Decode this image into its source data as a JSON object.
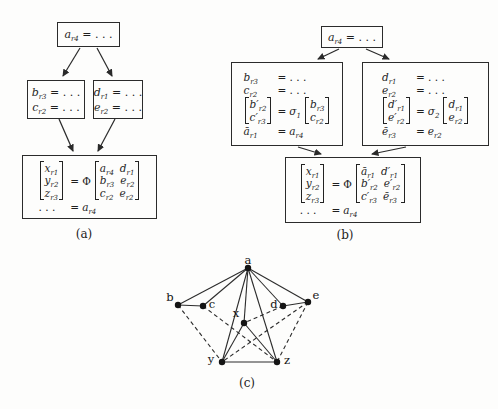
{
  "figure": {
    "bg": "#fdfdfc",
    "ink": "#222222",
    "dashed_color": "#2c2c2c"
  },
  "captions": {
    "a": "(a)",
    "b": "(b)",
    "c": "(c)"
  },
  "diagram_a": {
    "root": {
      "lhs": {
        "base": "a",
        "sub": "r4"
      },
      "rhs": "= . . ."
    },
    "left": {
      "lines": [
        {
          "lhs": {
            "base": "b",
            "sub": "r3"
          },
          "rhs": "= . . ."
        },
        {
          "lhs": {
            "base": "c",
            "sub": "r2"
          },
          "rhs": "= . . ."
        }
      ]
    },
    "right": {
      "lines": [
        {
          "lhs": {
            "base": "d",
            "sub": "r1"
          },
          "rhs": "= . . ."
        },
        {
          "lhs": {
            "base": "e",
            "sub": "r2"
          },
          "rhs": "= . . ."
        }
      ]
    },
    "bottom": {
      "vector": [
        {
          "base": "x",
          "sub": "r1"
        },
        {
          "base": "y",
          "sub": "r2"
        },
        {
          "base": "z",
          "sub": "r3"
        }
      ],
      "eq": "=",
      "phi": "Φ",
      "matrix": [
        [
          {
            "base": "a",
            "sub": "r4"
          },
          {
            "base": "d",
            "sub": "r1"
          }
        ],
        [
          {
            "base": "b",
            "sub": "r3"
          },
          {
            "base": "e",
            "sub": "r2"
          }
        ],
        [
          {
            "base": "c",
            "sub": "r2"
          },
          {
            "base": "e",
            "sub": "r2"
          }
        ]
      ],
      "tail_dots": ". . .",
      "tail_eq": "=",
      "tail_rhs": {
        "base": "a",
        "sub": "r4"
      }
    }
  },
  "diagram_b": {
    "root": {
      "lhs": {
        "base": "a",
        "sub": "r4"
      },
      "rhs": "= . . ."
    },
    "left": {
      "lines": [
        {
          "lhs": {
            "base": "b",
            "sub": "r3"
          },
          "rhs": "= . . ."
        },
        {
          "lhs": {
            "base": "c",
            "sub": "r2"
          },
          "rhs": "= . . ."
        }
      ],
      "veceq": {
        "lhs": [
          {
            "base": "b′",
            "sub": "r2"
          },
          {
            "base": "c′",
            "sub": "r3"
          }
        ],
        "eq": "=",
        "sigma": "σ",
        "sigma_sub": "1",
        "rhs": [
          {
            "base": "b",
            "sub": "r3"
          },
          {
            "base": "c",
            "sub": "r2"
          }
        ]
      },
      "tail": {
        "lhs": {
          "base": "ā",
          "sub": "r1"
        },
        "eq": "=",
        "rhs": {
          "base": "a",
          "sub": "r4"
        }
      }
    },
    "right": {
      "lines": [
        {
          "lhs": {
            "base": "d",
            "sub": "r1"
          },
          "rhs": "= . . ."
        },
        {
          "lhs": {
            "base": "e",
            "sub": "r2"
          },
          "rhs": "= . . ."
        }
      ],
      "veceq": {
        "lhs": [
          {
            "base": "d′",
            "sub": "r1"
          },
          {
            "base": "e′",
            "sub": "r2"
          }
        ],
        "eq": "=",
        "sigma": "σ",
        "sigma_sub": "2",
        "rhs": [
          {
            "base": "d",
            "sub": "r1"
          },
          {
            "base": "e",
            "sub": "r2"
          }
        ]
      },
      "tail": {
        "lhs": {
          "base": "ē",
          "sub": "r3"
        },
        "eq": "=",
        "rhs": {
          "base": "e",
          "sub": "r2"
        }
      }
    },
    "bottom": {
      "vector": [
        {
          "base": "x",
          "sub": "r1"
        },
        {
          "base": "y",
          "sub": "r2"
        },
        {
          "base": "z",
          "sub": "r3"
        }
      ],
      "eq": "=",
      "phi": "Φ",
      "matrix": [
        [
          {
            "base": "ā",
            "sub": "r1"
          },
          {
            "base": "d′",
            "sub": "r1"
          }
        ],
        [
          {
            "base": "b′",
            "sub": "r2"
          },
          {
            "base": "e′",
            "sub": "r2"
          }
        ],
        [
          {
            "base": "c′",
            "sub": "r3"
          },
          {
            "base": "ē",
            "sub": "r3"
          }
        ]
      ],
      "tail_dots": ". . .",
      "tail_eq": "=",
      "tail_rhs": {
        "base": "a",
        "sub": "r4"
      }
    }
  },
  "graph": {
    "nodes": [
      {
        "id": "a",
        "x": 248,
        "y": 268,
        "lx": 248,
        "ly": 260
      },
      {
        "id": "b",
        "x": 178,
        "y": 305,
        "lx": 170,
        "ly": 297
      },
      {
        "id": "c",
        "x": 203,
        "y": 306,
        "lx": 212,
        "ly": 304
      },
      {
        "id": "d",
        "x": 283,
        "y": 306,
        "lx": 274,
        "ly": 304
      },
      {
        "id": "e",
        "x": 308,
        "y": 302,
        "lx": 316,
        "ly": 295
      },
      {
        "id": "x",
        "x": 244,
        "y": 323,
        "lx": 236,
        "ly": 313
      },
      {
        "id": "y",
        "x": 222,
        "y": 362,
        "lx": 211,
        "ly": 359
      },
      {
        "id": "z",
        "x": 277,
        "y": 362,
        "lx": 287,
        "ly": 360
      }
    ],
    "edges": [
      {
        "from": "a",
        "to": "b",
        "style": "solid"
      },
      {
        "from": "a",
        "to": "c",
        "style": "solid"
      },
      {
        "from": "a",
        "to": "d",
        "style": "solid"
      },
      {
        "from": "a",
        "to": "e",
        "style": "solid"
      },
      {
        "from": "a",
        "to": "x",
        "style": "solid"
      },
      {
        "from": "a",
        "to": "y",
        "style": "solid"
      },
      {
        "from": "a",
        "to": "z",
        "style": "solid"
      },
      {
        "from": "b",
        "to": "c",
        "style": "solid"
      },
      {
        "from": "d",
        "to": "e",
        "style": "solid"
      },
      {
        "from": "x",
        "to": "y",
        "style": "solid"
      },
      {
        "from": "x",
        "to": "z",
        "style": "solid"
      },
      {
        "from": "y",
        "to": "z",
        "style": "solid"
      },
      {
        "from": "d",
        "to": "x",
        "style": "dashed"
      },
      {
        "from": "b",
        "to": "y",
        "style": "dashed"
      },
      {
        "from": "e",
        "to": "y",
        "style": "dashed"
      },
      {
        "from": "c",
        "to": "z",
        "style": "dashed"
      },
      {
        "from": "e",
        "to": "z",
        "style": "dashed"
      }
    ]
  }
}
